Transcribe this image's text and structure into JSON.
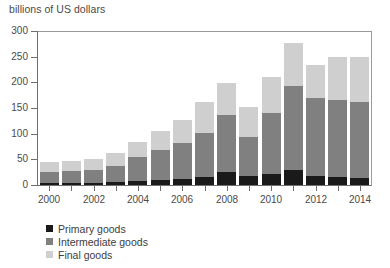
{
  "chart_data": {
    "type": "bar",
    "stacked": true,
    "title": "billions of US dollars",
    "subtitle": "",
    "xlabel": "",
    "ylabel": "billions of US dollars",
    "ylim": [
      0,
      300
    ],
    "yticks": [
      0,
      50,
      100,
      150,
      200,
      250,
      300
    ],
    "grid": false,
    "legend_position": "bottom-left",
    "categories": [
      "2000",
      "2001",
      "2002",
      "2003",
      "2004",
      "2005",
      "2006",
      "2007",
      "2008",
      "2009",
      "2010",
      "2011",
      "2012",
      "2013",
      "2014"
    ],
    "xtick_labels": [
      "2000",
      "2002",
      "2004",
      "2006",
      "2008",
      "2010",
      "2012",
      "2014"
    ],
    "series": [
      {
        "name": "Primary goods",
        "color": "#1a1a1a",
        "values": [
          3,
          3,
          4,
          5,
          8,
          9,
          11,
          16,
          25,
          18,
          22,
          30,
          17,
          15,
          14
        ]
      },
      {
        "name": "Intermediate goods",
        "color": "#808080",
        "values": [
          23,
          24,
          26,
          32,
          46,
          59,
          70,
          85,
          111,
          75,
          119,
          163,
          152,
          150,
          148
        ]
      },
      {
        "name": "Final goods",
        "color": "#cfcfcf",
        "values": [
          18,
          19,
          21,
          25,
          30,
          37,
          45,
          60,
          62,
          59,
          70,
          84,
          64,
          84,
          88
        ]
      }
    ],
    "totals": [
      44,
      46,
      51,
      62,
      84,
      105,
      126,
      161,
      198,
      152,
      211,
      277,
      233,
      249,
      250
    ]
  },
  "legend": {
    "items": [
      {
        "label": "Primary goods",
        "color": "#1a1a1a"
      },
      {
        "label": "Intermediate goods",
        "color": "#808080"
      },
      {
        "label": "Final goods",
        "color": "#cfcfcf"
      }
    ]
  },
  "colors": {
    "primary_goods": "#1a1a1a",
    "intermediate_goods": "#808080",
    "final_goods": "#cfcfcf",
    "axis": "#6f6f6f",
    "text": "#3d3d3d",
    "background": "#ffffff"
  }
}
